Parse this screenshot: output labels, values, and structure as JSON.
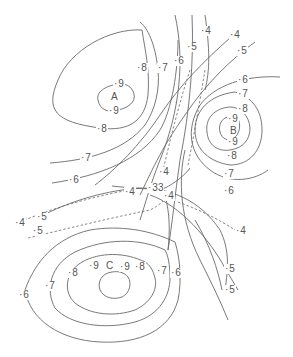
{
  "diagram": {
    "type": "contour-map",
    "line_color": "#6a6a6a",
    "text_color": "#555555",
    "centers": [
      {
        "id": "A",
        "label": "A"
      },
      {
        "id": "B",
        "label": "B"
      },
      {
        "id": "C",
        "label": "C"
      }
    ],
    "labels": {
      "a_8_top": "8",
      "a_9_top": "9",
      "a_9_bottom": "9",
      "a_8_bottom": "8",
      "left_7": "7",
      "left_6": "6",
      "top_7": "7",
      "top_6": "6",
      "top_5": "5",
      "top_4": "4",
      "ne_4": "4",
      "ne_5": "5",
      "b_6_top": "6",
      "b_7_top": "7",
      "b_8_top": "8",
      "b_9_top": "9",
      "b_9_bottom": "9",
      "b_8_bottom": "8",
      "b_7_bottom": "7",
      "b_6_bottom": "6",
      "mid_4_upper": "4",
      "mid_33": "33",
      "mid_4_left": "4",
      "mid_4_right": "4",
      "west_4": "4",
      "west_5_upper": "5",
      "west_5_lower": "5",
      "east_4_dashed": "4",
      "c_9_left": "9",
      "c_9_right": "9",
      "c_8_left": "8",
      "c_8_right": "8",
      "c_7_left": "7",
      "c_7_right": "7",
      "c_6_left": "6",
      "c_6_right": "6",
      "se_5_upper": "5",
      "se_5_lower": "5"
    }
  }
}
